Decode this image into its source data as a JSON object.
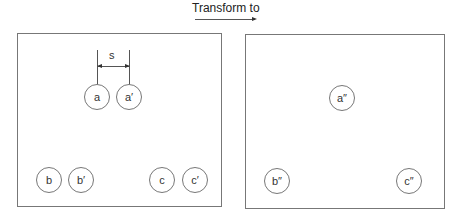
{
  "header": {
    "title": "Transform to"
  },
  "left_panel": {
    "dimension_label": "s",
    "circles": [
      {
        "label": "a"
      },
      {
        "label": "a′"
      },
      {
        "label": "b"
      },
      {
        "label": "b′"
      },
      {
        "label": "c"
      },
      {
        "label": "c′"
      }
    ]
  },
  "right_panel": {
    "circles": [
      {
        "label": "a″"
      },
      {
        "label": "b″"
      },
      {
        "label": "c″"
      }
    ]
  }
}
